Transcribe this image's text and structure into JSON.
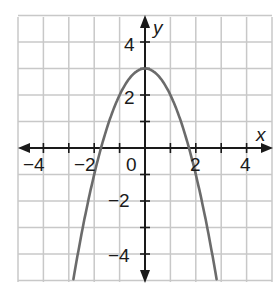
{
  "chart_data": {
    "type": "line",
    "title": "",
    "xlabel": "x",
    "ylabel": "y",
    "xlim": [
      -5,
      5
    ],
    "ylim": [
      -5,
      5
    ],
    "grid": true,
    "x_ticks": [
      -4,
      -3,
      -2,
      -1,
      0,
      1,
      2,
      3,
      4
    ],
    "y_ticks": [
      -4,
      -3,
      -2,
      -1,
      1,
      2,
      3,
      4
    ],
    "x_tick_labels": [
      {
        "value": -4,
        "label": "−4"
      },
      {
        "value": -2,
        "label": "−2"
      },
      {
        "value": 0,
        "label": "0"
      },
      {
        "value": 2,
        "label": "2"
      },
      {
        "value": 4,
        "label": "4"
      }
    ],
    "y_tick_labels": [
      {
        "value": 4,
        "label": "4"
      },
      {
        "value": 2,
        "label": "2"
      },
      {
        "value": -2,
        "label": "−2"
      },
      {
        "value": -4,
        "label": "−4"
      }
    ],
    "series": [
      {
        "name": "parabola",
        "equation": "y = 3 - x^2",
        "vertex": [
          0,
          3
        ],
        "x_intercepts": [
          -1.73,
          1.73
        ],
        "x": [
          -2.9,
          -2.5,
          -2,
          -1.5,
          -1,
          -0.5,
          0,
          0.5,
          1,
          1.5,
          2,
          2.5,
          2.9
        ],
        "y": [
          -5.41,
          -3.25,
          -1,
          0.75,
          2,
          2.75,
          3,
          2.75,
          2,
          0.75,
          -1,
          -3.25,
          -5.41
        ],
        "arrows_at_ends": true,
        "color": "#6b6b6b"
      }
    ],
    "colors": {
      "grid": "#c8c8c8",
      "axis": "#1a1a1a",
      "curve": "#6b6b6b"
    }
  },
  "labels": {
    "x_axis_name": "x",
    "y_axis_name": "y",
    "x4neg": "−4",
    "x2neg": "−2",
    "x0": "0",
    "x2": "2",
    "x4": "4",
    "y4": "4",
    "y2": "2",
    "y2neg": "−2",
    "y4neg": "−4"
  }
}
